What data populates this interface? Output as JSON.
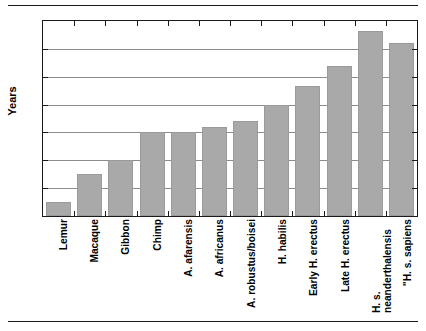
{
  "chart_data": {
    "type": "bar",
    "title": "",
    "xlabel": "",
    "ylabel": "Years",
    "ylim": [
      0,
      7
    ],
    "yticks": [
      0,
      1,
      2,
      3,
      4,
      5,
      6,
      7
    ],
    "grid": true,
    "legend": false,
    "bar_color": "#a9a9a9",
    "axis_color": "#1a1a1a",
    "grid_color": "#8c8c8c",
    "categories": [
      "Lemur",
      "Macaque",
      "Gibbon",
      "Chimp",
      "A. afarensis",
      "A. africanus",
      "A. robustus/boisei",
      "H. habilis",
      "Early H. erectus",
      "Late H. erectus",
      "H. s. neanderthalensis",
      "\"H. s. sapiens"
    ],
    "values": [
      0.5,
      1.5,
      2.0,
      3.0,
      3.0,
      3.2,
      3.4,
      4.0,
      4.65,
      5.4,
      6.65,
      6.2
    ]
  }
}
